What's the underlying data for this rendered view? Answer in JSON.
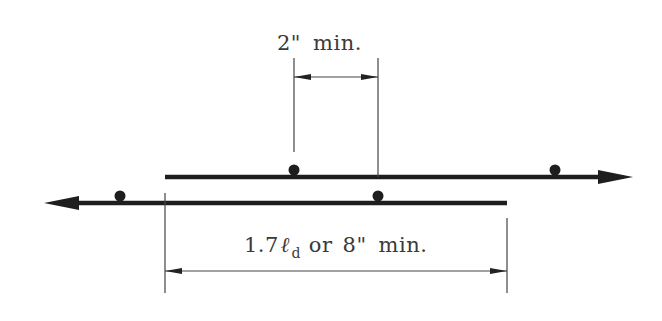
{
  "diagram": {
    "colors": {
      "bar": "#1e1e1e",
      "dimension_line": "#444444",
      "text": "#3a3a3a",
      "background": "#ffffff"
    },
    "top_dimension": {
      "value": "2\"",
      "suffix": "min."
    },
    "bottom_dimension": {
      "prefix": "1.7",
      "symbol": "ℓ",
      "subscript": "d",
      "connector": "or",
      "value": "8\"",
      "suffix": "min."
    },
    "bars": [
      {
        "name": "upper-bar",
        "arrow_direction": "right",
        "dots": 2
      },
      {
        "name": "lower-bar",
        "arrow_direction": "left",
        "dots": 2
      }
    ]
  }
}
